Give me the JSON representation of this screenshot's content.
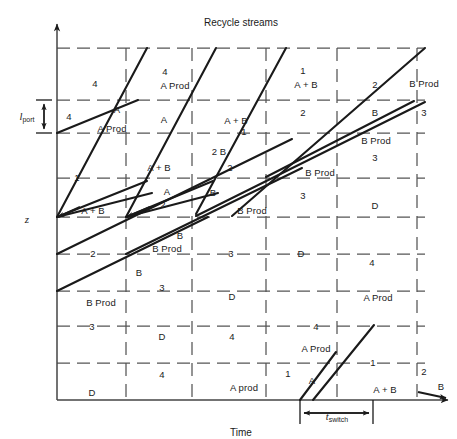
{
  "figure": {
    "title_top": "Recycle streams",
    "axis_y_label": "z",
    "axis_x_label": "Time",
    "port_label_var": "l",
    "port_label_sub": "port",
    "switch_label_var": "t",
    "switch_label_sub": "switch",
    "line_color": "#1a1a1a",
    "grid_color": "#555555",
    "axis_color": "#444444",
    "background": "#ffffff"
  },
  "plot": {
    "left": 57,
    "right": 425,
    "top": 28,
    "bottom": 400,
    "grid_x": [
      125,
      196,
      266,
      337,
      407,
      417
    ],
    "grid_y": [
      48,
      100,
      133,
      178,
      217,
      254,
      291,
      326,
      363
    ],
    "port_band": {
      "y_top": 100,
      "y_bottom": 133
    },
    "switch_band": {
      "x_left": 300,
      "x_right": 373,
      "y": 413
    }
  },
  "zone_labels": [
    {
      "id": "l01",
      "text": "4",
      "x": 95,
      "y": 84
    },
    {
      "id": "l02",
      "text": "4",
      "x": 165,
      "y": 72
    },
    {
      "id": "l03",
      "text": "A Prod",
      "x": 175,
      "y": 86
    },
    {
      "id": "l04",
      "text": "1",
      "x": 303,
      "y": 71
    },
    {
      "id": "l05",
      "text": "A + B",
      "x": 306,
      "y": 85
    },
    {
      "id": "l06",
      "text": "2",
      "x": 375,
      "y": 85
    },
    {
      "id": "l07",
      "text": "B Prod",
      "x": 424,
      "y": 84
    },
    {
      "id": "l08",
      "text": "4",
      "x": 69,
      "y": 117
    },
    {
      "id": "l09",
      "text": "A",
      "x": 117,
      "y": 110
    },
    {
      "id": "l10",
      "text": "A Prod",
      "x": 112,
      "y": 129
    },
    {
      "id": "l11",
      "text": "A",
      "x": 164,
      "y": 120
    },
    {
      "id": "l12",
      "text": "1",
      "x": 244,
      "y": 132
    },
    {
      "id": "l13",
      "text": "A + B",
      "x": 236,
      "y": 121
    },
    {
      "id": "l14",
      "text": "2",
      "x": 303,
      "y": 113
    },
    {
      "id": "l15",
      "text": "B",
      "x": 375,
      "y": 113
    },
    {
      "id": "l16",
      "text": "3",
      "x": 424,
      "y": 113
    },
    {
      "id": "l17",
      "text": "B Prod",
      "x": 376,
      "y": 141
    },
    {
      "id": "l18",
      "text": "2 B",
      "x": 219,
      "y": 152
    },
    {
      "id": "l19",
      "text": "3",
      "x": 375,
      "y": 158
    },
    {
      "id": "l20",
      "text": "1",
      "x": 77,
      "y": 178
    },
    {
      "id": "l21",
      "text": "A + B",
      "x": 159,
      "y": 168
    },
    {
      "id": "l22",
      "text": "2",
      "x": 230,
      "y": 168
    },
    {
      "id": "l23",
      "text": "B Prod",
      "x": 320,
      "y": 173
    },
    {
      "id": "l24",
      "text": "A",
      "x": 167,
      "y": 192
    },
    {
      "id": "l25",
      "text": "B",
      "x": 213,
      "y": 193
    },
    {
      "id": "l26",
      "text": "3",
      "x": 303,
      "y": 196
    },
    {
      "id": "l27",
      "text": "D",
      "x": 375,
      "y": 206
    },
    {
      "id": "l28",
      "text": "A + B",
      "x": 93,
      "y": 211
    },
    {
      "id": "l29",
      "text": "2",
      "x": 163,
      "y": 205
    },
    {
      "id": "l30",
      "text": "B Prod",
      "x": 252,
      "y": 211
    },
    {
      "id": "l31",
      "text": "B",
      "x": 180,
      "y": 236
    },
    {
      "id": "l32",
      "text": "2",
      "x": 93,
      "y": 254
    },
    {
      "id": "l33",
      "text": "B Prod",
      "x": 167,
      "y": 249
    },
    {
      "id": "l34",
      "text": "3",
      "x": 231,
      "y": 254
    },
    {
      "id": "l35",
      "text": "D",
      "x": 301,
      "y": 254
    },
    {
      "id": "l36",
      "text": "4",
      "x": 372,
      "y": 263
    },
    {
      "id": "l37",
      "text": "B",
      "x": 139,
      "y": 273
    },
    {
      "id": "l38",
      "text": "3",
      "x": 162,
      "y": 288
    },
    {
      "id": "l39",
      "text": "B Prod",
      "x": 101,
      "y": 303
    },
    {
      "id": "l40",
      "text": "D",
      "x": 232,
      "y": 297
    },
    {
      "id": "l41",
      "text": "4",
      "x": 316,
      "y": 327
    },
    {
      "id": "l42",
      "text": "A Prod",
      "x": 378,
      "y": 298
    },
    {
      "id": "l43",
      "text": "3",
      "x": 92,
      "y": 327
    },
    {
      "id": "l44",
      "text": "D",
      "x": 162,
      "y": 337
    },
    {
      "id": "l45",
      "text": "4",
      "x": 232,
      "y": 337
    },
    {
      "id": "l46",
      "text": "A Prod",
      "x": 316,
      "y": 349
    },
    {
      "id": "l47",
      "text": "1",
      "x": 373,
      "y": 363
    },
    {
      "id": "l48",
      "text": "4",
      "x": 162,
      "y": 375
    },
    {
      "id": "l49",
      "text": "D",
      "x": 92,
      "y": 393
    },
    {
      "id": "l50",
      "text": "A prod",
      "x": 244,
      "y": 388
    },
    {
      "id": "l51",
      "text": "1",
      "x": 288,
      "y": 374
    },
    {
      "id": "l52",
      "text": "A",
      "x": 312,
      "y": 381
    },
    {
      "id": "l53",
      "text": "A + B",
      "x": 385,
      "y": 390
    },
    {
      "id": "l54",
      "text": "2",
      "x": 424,
      "y": 372
    },
    {
      "id": "l55",
      "text": "B",
      "x": 441,
      "y": 387
    }
  ],
  "chart_data": {
    "type": "line",
    "title": "Recycle streams",
    "xlabel": "Time",
    "ylabel": "z",
    "grid": true,
    "legend": null,
    "annotations": [
      {
        "name": "port-length",
        "label": "l_port",
        "type": "vertical-dimension"
      },
      {
        "name": "switch-time",
        "label": "t_switch",
        "type": "horizontal-dimension"
      }
    ],
    "diagonals": [
      {
        "name": "A-front-1",
        "x1": 57,
        "y1": 133,
        "x2": 138,
        "y2": 100
      },
      {
        "name": "A-front-2",
        "x1": 57,
        "y1": 217,
        "x2": 144,
        "y2": 183
      },
      {
        "name": "A-front-3",
        "x1": 57,
        "y1": 217,
        "x2": 147,
        "y2": 192
      },
      {
        "name": "A-front-4",
        "x1": 126,
        "y1": 217,
        "x2": 208,
        "y2": 183
      },
      {
        "name": "A-front-5",
        "x1": 126,
        "y1": 217,
        "x2": 213,
        "y2": 192
      },
      {
        "name": "A-steep-1",
        "x1": 126,
        "y1": 217,
        "x2": 213,
        "y2": 48
      },
      {
        "name": "A-steep-2",
        "x1": 57,
        "y1": 217,
        "x2": 146,
        "y2": 48
      },
      {
        "name": "A-steep-3",
        "x1": 192,
        "y1": 216,
        "x2": 283,
        "y2": 48
      },
      {
        "name": "B-slow-1",
        "x1": 57,
        "y1": 291,
        "x2": 206,
        "y2": 217
      },
      {
        "name": "B-slow-2",
        "x1": 57,
        "y1": 254,
        "x2": 290,
        "y2": 140
      },
      {
        "name": "B-slow-3",
        "x1": 126,
        "y1": 254,
        "x2": 300,
        "y2": 168
      },
      {
        "name": "B-slow-4",
        "x1": 192,
        "y1": 217,
        "x2": 425,
        "y2": 100
      },
      {
        "name": "B-slow-5",
        "x1": 229,
        "y1": 217,
        "x2": 425,
        "y2": 48
      },
      {
        "name": "B-slow-6",
        "x1": 266,
        "y1": 176,
        "x2": 413,
        "y2": 100
      },
      {
        "name": "A-prod-1",
        "x1": 300,
        "y1": 400,
        "x2": 334,
        "y2": 354
      },
      {
        "name": "A-prod-2",
        "x1": 312,
        "y1": 400,
        "x2": 372,
        "y2": 326
      }
    ]
  }
}
